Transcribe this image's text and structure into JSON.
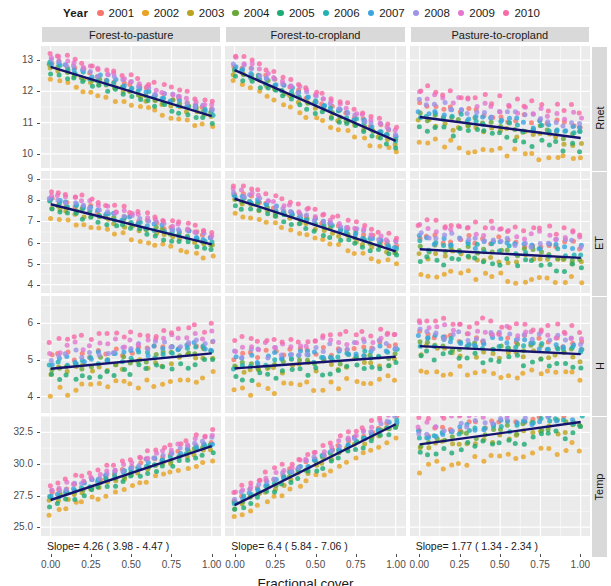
{
  "legend": {
    "title": "Year",
    "items": [
      {
        "label": "2001",
        "color": "#f8766d"
      },
      {
        "label": "2002",
        "color": "#e8a325"
      },
      {
        "label": "2003",
        "color": "#b8a521"
      },
      {
        "label": "2004",
        "color": "#68a83b"
      },
      {
        "label": "2005",
        "color": "#1eab75"
      },
      {
        "label": "2006",
        "color": "#21b2b2"
      },
      {
        "label": "2007",
        "color": "#3aa5e0"
      },
      {
        "label": "2008",
        "color": "#9f93e8"
      },
      {
        "label": "2009",
        "color": "#e377d0"
      },
      {
        "label": "2010",
        "color": "#f86ba6"
      }
    ]
  },
  "chart_data": {
    "type": "scatter",
    "title": "",
    "xlabel": "Fractional cover",
    "ylabel": "",
    "grid": true,
    "legend_position": "top",
    "facet_columns": [
      "Forest-to-pasture",
      "Forest-to-cropland",
      "Pasture-to-cropland"
    ],
    "facet_rows": [
      "Rnet",
      "ET",
      "H",
      "Temp"
    ],
    "x_ticks": [
      "0.00",
      "0.25",
      "0.50",
      "0.75",
      "1.00"
    ],
    "x_values": [
      0.0,
      0.25,
      0.5,
      0.75,
      1.0
    ],
    "xlim": [
      -0.06,
      1.06
    ],
    "rows": [
      {
        "name": "Rnet",
        "y_ticks": [
          "10",
          "11",
          "12",
          "13"
        ],
        "y_values": [
          10,
          11,
          12,
          13
        ],
        "ylim": [
          9.55,
          13.45
        ],
        "panels": [
          {
            "facet": "Forest-to-pasture",
            "slope": "Slope=  -1.57  ( -1.71  -  -1.49 )",
            "slope_value": -1.57,
            "ci_low": -1.71,
            "ci_high": -1.49,
            "fit_y0": 12.78,
            "fit_y1": 11.21
          },
          {
            "facet": "Forest-to-cropland",
            "slope": "Slope=  -2.26  ( -2.74  -  -2.28 )",
            "slope_value": -2.26,
            "ci_low": -2.74,
            "ci_high": -2.28,
            "fit_y0": 12.68,
            "fit_y1": 10.42
          },
          {
            "facet": "Pasture-to-cropland",
            "slope": "Slope=  -0.67  ( -1.12  -  -0.6 )",
            "slope_value": -0.67,
            "ci_low": -1.12,
            "ci_high": -0.6,
            "fit_y0": 11.18,
            "fit_y1": 10.51
          }
        ]
      },
      {
        "name": "ET",
        "y_ticks": [
          "4",
          "5",
          "6",
          "7",
          "8",
          "9"
        ],
        "y_values": [
          4,
          5,
          6,
          7,
          8,
          9
        ],
        "ylim": [
          3.6,
          9.4
        ],
        "panels": [
          {
            "facet": "Forest-to-pasture",
            "slope": "Slope=  -1.91  ( -2.69  -  -1.31 )",
            "slope_value": -1.91,
            "ci_low": -2.69,
            "ci_high": -1.31,
            "fit_y0": 7.82,
            "fit_y1": 5.91
          },
          {
            "facet": "Forest-to-cropland",
            "slope": "Slope=  -2.5  ( -3.71  -  -1.7 )",
            "slope_value": -2.5,
            "ci_low": -3.71,
            "ci_high": -1.7,
            "fit_y0": 8.08,
            "fit_y1": 5.58
          },
          {
            "facet": "Pasture-to-cropland",
            "slope": "Slope=  -0.41  ( -1.04  -  -0.04 )",
            "slope_value": -0.41,
            "ci_low": -1.04,
            "ci_high": -0.04,
            "fit_y0": 5.68,
            "fit_y1": 5.27
          }
        ]
      },
      {
        "name": "H",
        "y_ticks": [
          "4",
          "5",
          "6"
        ],
        "y_values": [
          4,
          5,
          6
        ],
        "ylim": [
          3.55,
          6.75
        ],
        "panels": [
          {
            "facet": "Forest-to-pasture",
            "slope": "Slope=  0.42  ( -0.2  -  1.19 )",
            "slope_value": 0.42,
            "ci_low": -0.2,
            "ci_high": 1.19,
            "fit_y0": 4.76,
            "fit_y1": 5.18
          },
          {
            "facet": "Forest-to-cropland",
            "slope": "Slope=  0.32  ( -0.56  -  1.41 )",
            "slope_value": 0.32,
            "ci_low": -0.56,
            "ci_high": 1.41,
            "fit_y0": 4.77,
            "fit_y1": 5.09
          },
          {
            "facet": "Pasture-to-cropland",
            "slope": "Slope=  -0.22  ( -0.8  -  0.27 )",
            "slope_value": -0.22,
            "ci_low": -0.8,
            "ci_high": 0.27,
            "fit_y0": 5.38,
            "fit_y1": 5.16
          }
        ]
      },
      {
        "name": "Temp",
        "y_ticks": [
          "25.0",
          "27.5",
          "30.0",
          "32.5"
        ],
        "y_values": [
          25.0,
          27.5,
          30.0,
          32.5
        ],
        "ylim": [
          24.3,
          33.8
        ],
        "panels": [
          {
            "facet": "Forest-to-pasture",
            "slope": "Slope=  4.26  ( 3.98  -  4.47 )",
            "slope_value": 4.26,
            "ci_low": 3.98,
            "ci_high": 4.47,
            "fit_y0": 27.15,
            "fit_y1": 31.41
          },
          {
            "facet": "Forest-to-cropland",
            "slope": "Slope=  6.4  ( 5.84  -  7.06 )",
            "slope_value": 6.4,
            "ci_low": 5.84,
            "ci_high": 7.06,
            "fit_y0": 26.75,
            "fit_y1": 33.15
          },
          {
            "facet": "Pasture-to-cropland",
            "slope": "Slope=  1.77  ( 1.34  -  2.34 )",
            "slope_value": 1.77,
            "ci_low": 1.34,
            "ci_high": 2.34,
            "fit_y0": 31.55,
            "fit_y1": 33.32
          }
        ]
      }
    ]
  },
  "style": {
    "panel_background": "#ebebeb",
    "grid_color": "#ffffff",
    "strip_background": "#d9d9d9",
    "fit_line_color": "#14146e",
    "axis_text_color": "#4d4d4d"
  }
}
